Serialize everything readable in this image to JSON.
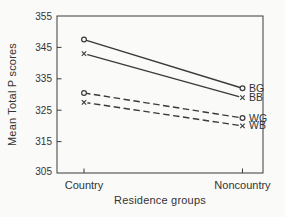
{
  "figure": {
    "background": "#fafaf9",
    "ink": "#3a3a3a"
  },
  "chart_data": {
    "type": "line",
    "title": "",
    "xlabel": "Residence groups",
    "ylabel": "Mean Total P scores",
    "categories": [
      "Country",
      "Noncountry"
    ],
    "ylim": [
      305,
      355
    ],
    "yticks": [
      355,
      345,
      335,
      325,
      315,
      305
    ],
    "grid": false,
    "legend_position": "right-end-labels",
    "series": [
      {
        "name": "BG",
        "values": [
          347.5,
          332
        ],
        "line_style": "solid",
        "marker": "circle"
      },
      {
        "name": "BB",
        "values": [
          343,
          329
        ],
        "line_style": "solid",
        "marker": "x"
      },
      {
        "name": "WG",
        "values": [
          330.5,
          322.5
        ],
        "line_style": "dashed",
        "marker": "circle"
      },
      {
        "name": "WB",
        "values": [
          327.5,
          320
        ],
        "line_style": "dashed",
        "marker": "x"
      }
    ]
  }
}
